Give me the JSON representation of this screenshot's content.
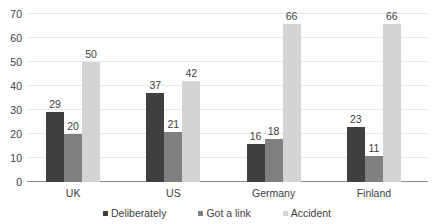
{
  "chart_data": {
    "type": "bar",
    "title": "",
    "subtitle": "",
    "xlabel": "",
    "ylabel": "",
    "categories": [
      "UK",
      "US",
      "Germany",
      "Finland"
    ],
    "series": [
      {
        "name": "Deliberately",
        "color": "#404040",
        "values": [
          29,
          37,
          16,
          23
        ]
      },
      {
        "name": "Got a link",
        "color": "#808080",
        "values": [
          20,
          21,
          18,
          11
        ]
      },
      {
        "name": "Accident",
        "color": "#d4d4d4",
        "values": [
          50,
          42,
          66,
          66
        ]
      }
    ],
    "ylim": [
      0,
      70
    ],
    "ytick_labels": [
      "0",
      "10",
      "20",
      "30",
      "40",
      "50",
      "60",
      "70"
    ],
    "ytick_values": [
      0,
      10,
      20,
      30,
      40,
      50,
      60,
      70
    ],
    "grid": true,
    "grid_color": "#e8e8e8",
    "axis_color": "#8d8d8d",
    "legend_position": "bottom",
    "data_labels": true,
    "data_labels_text": [
      [
        "29",
        "20",
        "50"
      ],
      [
        "37",
        "21",
        "42"
      ],
      [
        "16",
        "18",
        "66"
      ],
      [
        "23",
        "11",
        "66"
      ]
    ]
  }
}
